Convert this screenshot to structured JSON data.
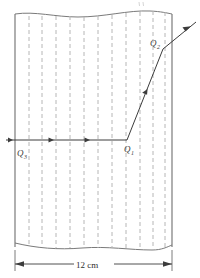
{
  "figure": {
    "name": "refraction-through-slab-diagram",
    "dimension_label": "12 cm",
    "labels": {
      "entry_point": "Q",
      "entry_point_sub": "3",
      "bend_point": "Q",
      "bend_point_sub": "1",
      "exit_point": "Q",
      "exit_point_sub": "2"
    },
    "colors": {
      "border": "#6e6e6e",
      "dashed_line": "#b4b4b4",
      "ray": "#3c3c3c",
      "text": "#333333",
      "background": "#ffffff"
    },
    "geometry": {
      "slab_left_x": 15,
      "slab_right_x": 172,
      "slab_top_y": 13,
      "slab_bottom_y": 247,
      "dashed_line_count": 11,
      "ray_y": 140,
      "bend_x": 127,
      "exit_x": 172,
      "exit_y": 47
    }
  }
}
